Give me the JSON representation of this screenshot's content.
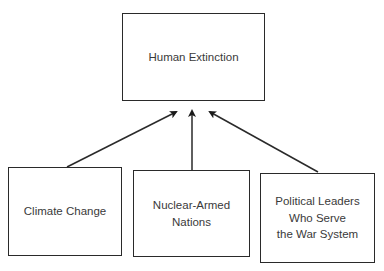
{
  "diagram": {
    "top": {
      "label": "Human Extinction"
    },
    "causes": [
      {
        "label": "Climate Change"
      },
      {
        "label": "Nuclear-Armed\nNations"
      },
      {
        "label": "Political Leaders\nWho Serve\nthe War System"
      }
    ],
    "colors": {
      "line": "#2a2a2a",
      "text": "#3a3a3a",
      "background": "#ffffff"
    }
  }
}
